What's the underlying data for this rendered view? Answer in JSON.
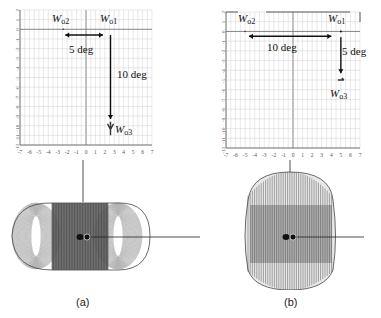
{
  "panels": [
    {
      "id": "a",
      "caption": "(a)",
      "grid": {
        "x_min": -7,
        "x_max": 7,
        "y_min": -12,
        "y_max": 2,
        "x_ticks": [
          "-7",
          "-6",
          "-5",
          "-4",
          "-3",
          "-2",
          "-1",
          "0",
          "1",
          "2",
          "3",
          "4",
          "5",
          "6",
          "7"
        ],
        "y_ticks": [
          "2",
          "1",
          "0",
          "-1",
          "-2",
          "-3",
          "-4",
          "-5",
          "-6",
          "-7",
          "-8",
          "-9",
          "-10",
          "-11",
          "-12"
        ]
      },
      "points": {
        "wo1": {
          "label": "W",
          "sub": "o1",
          "x": 2.6,
          "y": 0
        },
        "wo2": {
          "label": "W",
          "sub": "o2",
          "x": -2.4,
          "y": 0
        },
        "wo3": {
          "label": "W",
          "sub": "o3",
          "x": 2.6,
          "y": -10
        }
      },
      "arrows": [
        {
          "label": "5 deg",
          "from": [
            -2.2,
            -0.6
          ],
          "to": [
            1.8,
            -0.6
          ]
        },
        {
          "label": "10 deg",
          "from": [
            2.6,
            -0.6
          ],
          "to": [
            2.6,
            -9.3
          ]
        }
      ],
      "shape": "wide-torus"
    },
    {
      "id": "b",
      "caption": "(b)",
      "grid": {
        "x_min": -7,
        "x_max": 7,
        "y_min": -12,
        "y_max": 2,
        "x_ticks": [
          "-7",
          "-6",
          "-5",
          "-4",
          "-3",
          "-2",
          "-1",
          "0",
          "1",
          "2",
          "3",
          "4",
          "5",
          "6",
          "7"
        ],
        "y_ticks": [
          "2",
          "1",
          "0",
          "-1",
          "-2",
          "-3",
          "-4",
          "-5",
          "-6",
          "-7",
          "-8",
          "-9",
          "-10",
          "-11",
          "-12"
        ]
      },
      "points": {
        "wo1": {
          "label": "W",
          "sub": "o1",
          "x": 5,
          "y": 0
        },
        "wo2": {
          "label": "W",
          "sub": "o2",
          "x": -5,
          "y": 0
        },
        "wo3": {
          "label": "W",
          "sub": "o3",
          "x": 5,
          "y": -5
        }
      },
      "arrows": [
        {
          "label": "10 deg",
          "from": [
            -4.6,
            -0.5
          ],
          "to": [
            4.0,
            -0.5
          ]
        },
        {
          "label": "5 deg",
          "from": [
            5,
            -0.6
          ],
          "to": [
            5,
            -4.3
          ]
        }
      ],
      "shape": "tall-barrel"
    }
  ]
}
